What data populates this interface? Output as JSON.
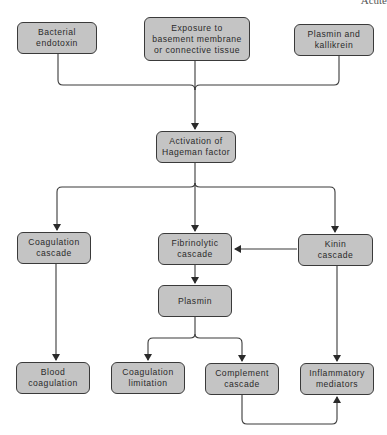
{
  "corner_label": "Acute",
  "nodes": {
    "bacterial_endotoxin": "Bacterial\nendotoxin",
    "exposure": "Exposure to\nbasement membrane\nor connective tissue",
    "plasmin_kallikrein": "Plasmin and\nkallikrein",
    "hageman": "Activation of\nHageman factor",
    "coagulation_cascade": "Coagulation\ncascade",
    "fibrinolytic_cascade": "Fibrinolytic\ncascade",
    "kinin_cascade": "Kinin\ncascade",
    "plasmin": "Plasmin",
    "blood_coagulation": "Blood\ncoagulation",
    "coagulation_limitation": "Coagulation\nlimitation",
    "complement_cascade": "Complement\ncascade",
    "inflammatory_mediators": "Inflammatory\nmediators"
  },
  "edges": [
    {
      "from": "bacterial_endotoxin",
      "to": "hageman"
    },
    {
      "from": "exposure",
      "to": "hageman"
    },
    {
      "from": "plasmin_kallikrein",
      "to": "hageman"
    },
    {
      "from": "hageman",
      "to": "coagulation_cascade"
    },
    {
      "from": "hageman",
      "to": "fibrinolytic_cascade"
    },
    {
      "from": "hageman",
      "to": "kinin_cascade"
    },
    {
      "from": "kinin_cascade",
      "to": "fibrinolytic_cascade"
    },
    {
      "from": "fibrinolytic_cascade",
      "to": "plasmin"
    },
    {
      "from": "coagulation_cascade",
      "to": "blood_coagulation"
    },
    {
      "from": "plasmin",
      "to": "coagulation_limitation"
    },
    {
      "from": "plasmin",
      "to": "complement_cascade"
    },
    {
      "from": "kinin_cascade",
      "to": "inflammatory_mediators"
    },
    {
      "from": "complement_cascade",
      "to": "inflammatory_mediators"
    }
  ]
}
